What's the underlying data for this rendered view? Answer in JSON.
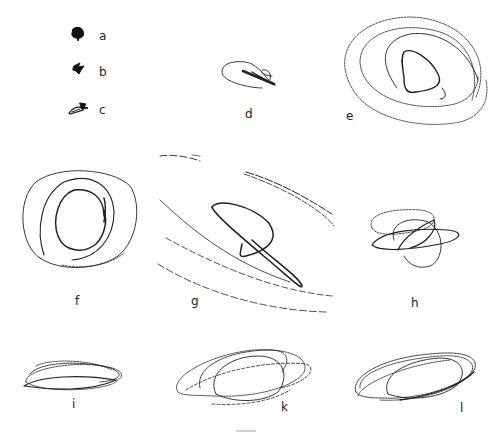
{
  "figure": {
    "panels": [
      {
        "id": "a",
        "label": "a",
        "x": 99,
        "y": 30
      },
      {
        "id": "b",
        "label": "b",
        "x": 99,
        "y": 68
      },
      {
        "id": "c",
        "label": "c",
        "x": 99,
        "y": 105
      },
      {
        "id": "d",
        "label": "d",
        "x": 245,
        "y": 110
      },
      {
        "id": "e",
        "label": "e",
        "x": 346,
        "y": 111
      },
      {
        "id": "f",
        "label": "f",
        "x": 75,
        "y": 295
      },
      {
        "id": "g",
        "label": "g",
        "x": 191,
        "y": 296
      },
      {
        "id": "h",
        "label": "h",
        "x": 412,
        "y": 297
      },
      {
        "id": "i",
        "label": "i",
        "x": 72,
        "y": 400
      },
      {
        "id": "k",
        "label": "k",
        "x": 281,
        "y": 402
      },
      {
        "id": "l",
        "label": "l",
        "x": 460,
        "y": 404
      }
    ],
    "colors": {
      "ink": "#222222",
      "background": "#ffffff"
    }
  }
}
